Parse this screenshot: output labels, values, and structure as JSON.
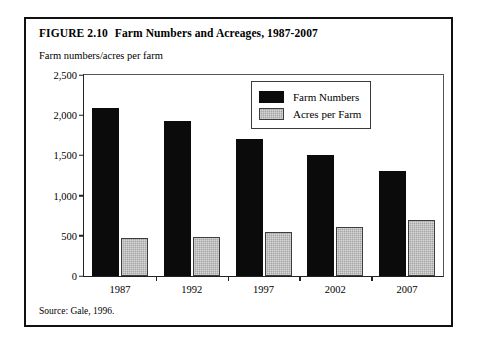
{
  "figure": {
    "number": "FIGURE 2.10",
    "title": "Farm Numbers and Acreages, 1987-2007",
    "axis_caption": "Farm numbers/acres per farm",
    "source": "Source: Gale, 1996."
  },
  "chart_data": {
    "type": "bar",
    "title": "Farm Numbers and Acreages, 1987-2007",
    "xlabel": "",
    "ylabel": "Farm numbers/acres per farm",
    "categories": [
      "1987",
      "1992",
      "1997",
      "2002",
      "2007"
    ],
    "series": [
      {
        "name": "Farm Numbers",
        "color": "#0b0b0b",
        "values": [
          2090,
          1930,
          1700,
          1500,
          1310
        ]
      },
      {
        "name": "Acres per Farm",
        "color": "#a6a6a6",
        "values": [
          470,
          490,
          550,
          610,
          700
        ]
      }
    ],
    "ylim": [
      0,
      2500
    ],
    "yticks": [
      0,
      500,
      1000,
      1500,
      2000,
      2500
    ],
    "ytick_labels": [
      "0",
      "500",
      "1,000",
      "1,500",
      "2,000",
      "2,500"
    ],
    "grid": false,
    "legend_position": "upper-center-right"
  }
}
